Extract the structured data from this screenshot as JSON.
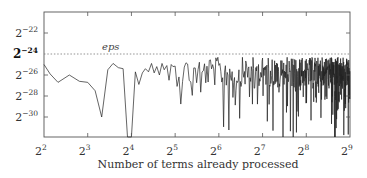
{
  "chart_data": {
    "type": "line",
    "title": "",
    "xlabel": "Number of terms already processed",
    "ylabel": "",
    "x_scale": "log2",
    "y_scale": "log2",
    "xlim_exponent": [
      2,
      9
    ],
    "ylim_exponent": [
      -20,
      -32
    ],
    "grid": false,
    "x_ticks": [
      {
        "base": "2",
        "exp": "2",
        "value": 4
      },
      {
        "base": "2",
        "exp": "3",
        "value": 8
      },
      {
        "base": "2",
        "exp": "4",
        "value": 16
      },
      {
        "base": "2",
        "exp": "5",
        "value": 32
      },
      {
        "base": "2",
        "exp": "6",
        "value": 64
      },
      {
        "base": "2",
        "exp": "7",
        "value": 128
      },
      {
        "base": "2",
        "exp": "8",
        "value": 256
      },
      {
        "base": "2",
        "exp": "9",
        "value": 512
      }
    ],
    "y_ticks": [
      {
        "base": "2",
        "exp": "−22",
        "value": -22,
        "bold": false
      },
      {
        "base": "2",
        "exp": "−24",
        "value": -24,
        "bold": true
      },
      {
        "base": "2",
        "exp": "−26",
        "value": -26,
        "bold": false
      },
      {
        "base": "2",
        "exp": "−28",
        "value": -28,
        "bold": false
      },
      {
        "base": "2",
        "exp": "−30",
        "value": -30,
        "bold": false
      }
    ],
    "reference_line": {
      "label": "eps",
      "y_exponent": -24,
      "style": "dotted"
    },
    "series": [
      {
        "name": "relative error",
        "x_log2": [
          2.0,
          2.14,
          2.32,
          2.58,
          2.81,
          3.0,
          3.17,
          3.32,
          3.46,
          3.58,
          3.7,
          3.81,
          3.91,
          4.0,
          4.09,
          4.17,
          4.25,
          4.32,
          4.39,
          4.46,
          4.52,
          4.58,
          4.64,
          4.7,
          4.75,
          4.81,
          4.86,
          4.91,
          4.95
        ],
        "y_log2": [
          -25.0,
          -25.9,
          -26.7,
          -26.0,
          -26.6,
          -26.7,
          -27.5,
          -30.0,
          -25.5,
          -24.9,
          -25.3,
          -25.4,
          -32.5,
          -32.5,
          -25.7,
          -26.9,
          -25.8,
          -25.4,
          -25.7,
          -24.9,
          -25.8,
          -25.2,
          -26.0,
          -24.9,
          -25.5,
          -25.1,
          -26.5,
          -25.0,
          -25.2
        ]
      }
    ],
    "dense_region": {
      "x_log2_start": 5.0,
      "x_log2_end": 9.0,
      "y_log2_upper": -24.3,
      "y_log2_typical": [
        -25,
        -27
      ],
      "y_log2_min_spikes": -32
    }
  }
}
